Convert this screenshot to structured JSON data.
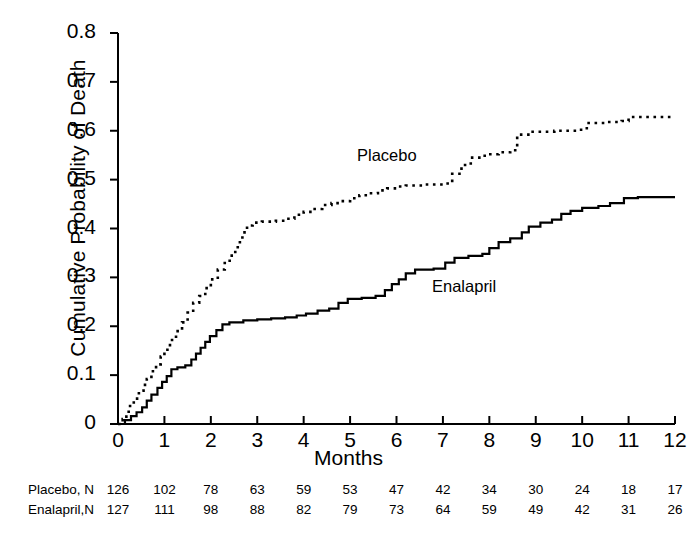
{
  "chart_data": {
    "type": "line",
    "title": "",
    "xlabel": "Months",
    "ylabel": "Cumulative Probability of Death",
    "xlim": [
      0,
      12
    ],
    "ylim": [
      0,
      0.8
    ],
    "grid": false,
    "legend_position": "inline-annotation",
    "xticks": [
      "0",
      "1",
      "2",
      "3",
      "4",
      "5",
      "6",
      "7",
      "8",
      "9",
      "10",
      "11",
      "12"
    ],
    "yticks": [
      "0",
      "0.1",
      "0.2",
      "0.3",
      "0.4",
      "0.5",
      "0.6",
      "0.7",
      "0.8"
    ],
    "annotations": [
      {
        "text": "Placebo",
        "x": 5.3,
        "y": 0.565
      },
      {
        "text": "Enalapril",
        "x": 6.9,
        "y": 0.295
      }
    ],
    "series": [
      {
        "name": "Placebo",
        "style": "dotted",
        "color": "#000000",
        "step": "post",
        "points": [
          [
            0.0,
            0.0
          ],
          [
            0.1,
            0.01
          ],
          [
            0.18,
            0.025
          ],
          [
            0.26,
            0.04
          ],
          [
            0.34,
            0.052
          ],
          [
            0.45,
            0.068
          ],
          [
            0.55,
            0.08
          ],
          [
            0.62,
            0.092
          ],
          [
            0.72,
            0.108
          ],
          [
            0.82,
            0.122
          ],
          [
            0.92,
            0.138
          ],
          [
            1.0,
            0.152
          ],
          [
            1.12,
            0.172
          ],
          [
            1.25,
            0.19
          ],
          [
            1.38,
            0.208
          ],
          [
            1.5,
            0.228
          ],
          [
            1.62,
            0.248
          ],
          [
            1.75,
            0.262
          ],
          [
            1.88,
            0.278
          ],
          [
            2.0,
            0.296
          ],
          [
            2.15,
            0.316
          ],
          [
            2.3,
            0.334
          ],
          [
            2.45,
            0.352
          ],
          [
            2.58,
            0.372
          ],
          [
            2.68,
            0.392
          ],
          [
            2.78,
            0.406
          ],
          [
            2.9,
            0.412
          ],
          [
            3.1,
            0.414
          ],
          [
            3.4,
            0.416
          ],
          [
            3.6,
            0.42
          ],
          [
            3.8,
            0.428
          ],
          [
            4.0,
            0.434
          ],
          [
            4.2,
            0.44
          ],
          [
            4.4,
            0.448
          ],
          [
            4.6,
            0.452
          ],
          [
            4.8,
            0.456
          ],
          [
            5.0,
            0.462
          ],
          [
            5.2,
            0.468
          ],
          [
            5.4,
            0.472
          ],
          [
            5.6,
            0.478
          ],
          [
            5.8,
            0.482
          ],
          [
            6.0,
            0.486
          ],
          [
            6.2,
            0.488
          ],
          [
            6.6,
            0.49
          ],
          [
            7.0,
            0.492
          ],
          [
            7.2,
            0.512
          ],
          [
            7.4,
            0.53
          ],
          [
            7.6,
            0.545
          ],
          [
            7.9,
            0.552
          ],
          [
            8.2,
            0.556
          ],
          [
            8.45,
            0.56
          ],
          [
            8.6,
            0.592
          ],
          [
            8.9,
            0.598
          ],
          [
            9.4,
            0.6
          ],
          [
            9.9,
            0.602
          ],
          [
            10.1,
            0.616
          ],
          [
            10.5,
            0.618
          ],
          [
            10.85,
            0.62
          ],
          [
            11.0,
            0.628
          ],
          [
            11.5,
            0.628
          ],
          [
            12.0,
            0.628
          ]
        ]
      },
      {
        "name": "Enalapril",
        "style": "solid",
        "color": "#000000",
        "step": "post",
        "points": [
          [
            0.0,
            0.0
          ],
          [
            0.15,
            0.008
          ],
          [
            0.28,
            0.016
          ],
          [
            0.4,
            0.024
          ],
          [
            0.52,
            0.034
          ],
          [
            0.62,
            0.048
          ],
          [
            0.72,
            0.06
          ],
          [
            0.85,
            0.074
          ],
          [
            0.95,
            0.086
          ],
          [
            1.05,
            0.098
          ],
          [
            1.15,
            0.112
          ],
          [
            1.28,
            0.116
          ],
          [
            1.45,
            0.12
          ],
          [
            1.58,
            0.132
          ],
          [
            1.68,
            0.144
          ],
          [
            1.78,
            0.156
          ],
          [
            1.88,
            0.168
          ],
          [
            1.98,
            0.18
          ],
          [
            2.12,
            0.192
          ],
          [
            2.25,
            0.204
          ],
          [
            2.4,
            0.208
          ],
          [
            2.7,
            0.212
          ],
          [
            3.0,
            0.214
          ],
          [
            3.3,
            0.216
          ],
          [
            3.6,
            0.218
          ],
          [
            3.85,
            0.222
          ],
          [
            4.05,
            0.226
          ],
          [
            4.3,
            0.232
          ],
          [
            4.55,
            0.236
          ],
          [
            4.75,
            0.248
          ],
          [
            4.95,
            0.256
          ],
          [
            5.25,
            0.258
          ],
          [
            5.55,
            0.262
          ],
          [
            5.75,
            0.274
          ],
          [
            5.9,
            0.286
          ],
          [
            6.05,
            0.296
          ],
          [
            6.2,
            0.308
          ],
          [
            6.4,
            0.316
          ],
          [
            6.8,
            0.318
          ],
          [
            7.05,
            0.33
          ],
          [
            7.25,
            0.34
          ],
          [
            7.55,
            0.344
          ],
          [
            7.85,
            0.348
          ],
          [
            8.0,
            0.36
          ],
          [
            8.2,
            0.372
          ],
          [
            8.45,
            0.38
          ],
          [
            8.7,
            0.392
          ],
          [
            8.85,
            0.404
          ],
          [
            9.1,
            0.412
          ],
          [
            9.35,
            0.418
          ],
          [
            9.55,
            0.43
          ],
          [
            9.75,
            0.436
          ],
          [
            10.0,
            0.442
          ],
          [
            10.35,
            0.446
          ],
          [
            10.6,
            0.452
          ],
          [
            10.9,
            0.462
          ],
          [
            11.2,
            0.464
          ],
          [
            11.6,
            0.464
          ],
          [
            12.0,
            0.464
          ]
        ]
      }
    ]
  },
  "axis": {
    "ylabel": "Cumulative Probability of Death",
    "xlabel": "Months",
    "yticks": [
      "0.8",
      "0.7",
      "0.6",
      "0.5",
      "0.4",
      "0.3",
      "0.2",
      "0.1",
      "0"
    ],
    "xticks": [
      "0",
      "1",
      "2",
      "3",
      "4",
      "5",
      "6",
      "7",
      "8",
      "9",
      "10",
      "11",
      "12"
    ]
  },
  "curve_labels": {
    "placebo": "Placebo",
    "enalapril": "Enalapril"
  },
  "risk_table": {
    "rows": [
      {
        "name": "Placebo, N",
        "values": [
          "126",
          "102",
          "78",
          "63",
          "59",
          "53",
          "47",
          "42",
          "34",
          "30",
          "24",
          "18",
          "17"
        ]
      },
      {
        "name": "Enalapril,N",
        "values": [
          "127",
          "111",
          "98",
          "88",
          "82",
          "79",
          "73",
          "64",
          "59",
          "49",
          "42",
          "31",
          "26"
        ]
      }
    ]
  }
}
